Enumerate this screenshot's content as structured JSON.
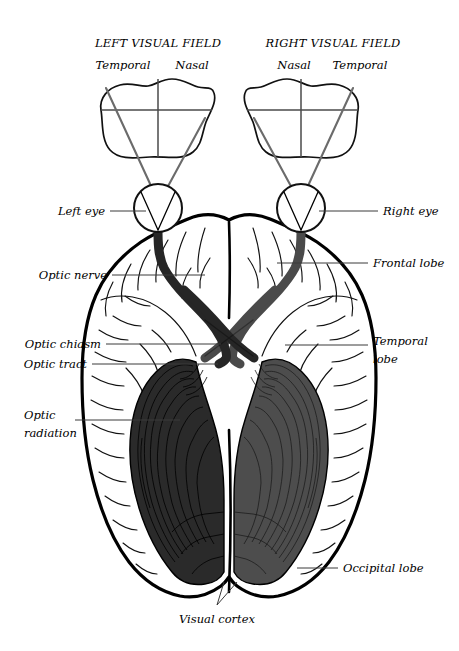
{
  "figure": {
    "background_color": "#ffffff"
  },
  "visual_fields": {
    "left": {
      "title": "LEFT VISUAL FIELD",
      "half_labels": {
        "outer": "Temporal",
        "inner": "Nasal"
      }
    },
    "right": {
      "title": "RIGHT VISUAL FIELD",
      "half_labels": {
        "inner": "Nasal",
        "outer": "Temporal"
      }
    }
  },
  "annotations": {
    "left_eye": "Left eye",
    "optic_nerve": "Optic nerve",
    "optic_chiasm": "Optic chiasm",
    "optic_tract": "Optic tract",
    "optic_radiation_line1": "Optic",
    "optic_radiation_line2": "radiation",
    "right_eye": "Right eye",
    "frontal_lobe": "Frontal lobe",
    "temporal_lobe_line1": "Temporal",
    "temporal_lobe_line2": "lobe",
    "occipital_lobe": "Occipital lobe",
    "visual_cortex": "Visual cortex"
  },
  "colors": {
    "left_pathway": "#2a2a2a",
    "right_pathway": "#4d4d4d",
    "brain_outline": "#000000",
    "ray": "#6b6b6b",
    "leader_line": "#3b3b3b"
  }
}
